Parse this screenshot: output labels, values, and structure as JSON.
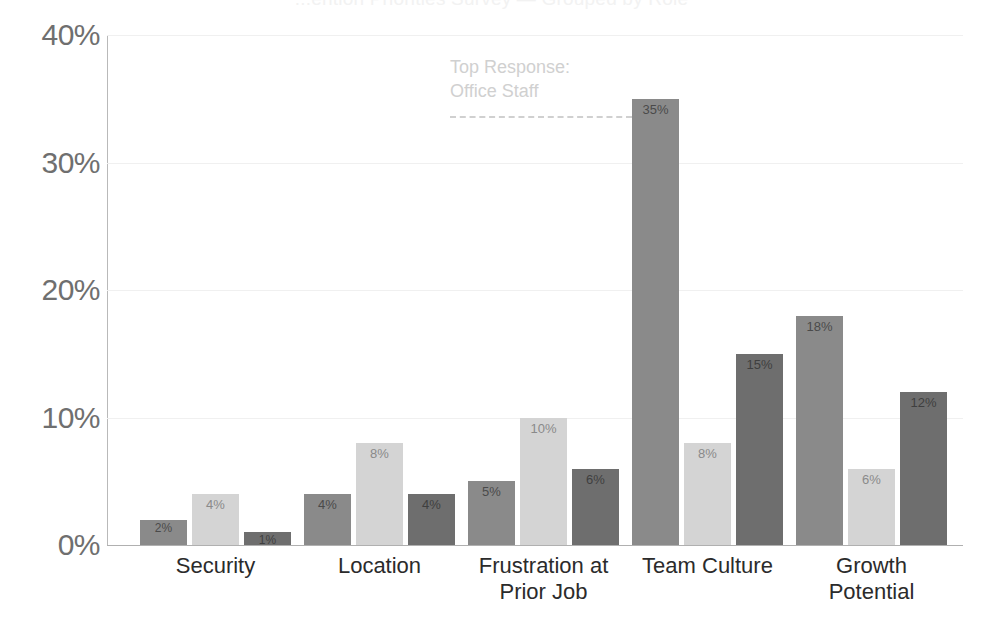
{
  "chart_data": {
    "type": "bar",
    "title": "...ention Priorities Survey — Grouped by Role",
    "xlabel": "",
    "ylabel": "",
    "ylim": [
      0,
      40
    ],
    "grid": true,
    "legend_position": "none",
    "y_ticks": [
      "0%",
      "10%",
      "20%",
      "30%",
      "40%"
    ],
    "y_tick_values": [
      0,
      10,
      20,
      30,
      40
    ],
    "categories": [
      "Security",
      "Location",
      "Frustration at\nPrior Job",
      "Team Culture",
      "Growth\nPotential"
    ],
    "series": [
      {
        "name": "Series 1",
        "color": "#8a8a8a",
        "values": [
          2,
          4,
          5,
          35,
          18
        ],
        "labels": [
          "2%",
          "4%",
          "5%",
          "35%",
          "18%"
        ]
      },
      {
        "name": "Series 2",
        "color": "#d4d4d4",
        "values": [
          4,
          8,
          10,
          8,
          6
        ],
        "labels": [
          "4%",
          "8%",
          "10%",
          "8%",
          "6%"
        ]
      },
      {
        "name": "Series 3",
        "color": "#6e6e6e",
        "values": [
          1,
          4,
          6,
          15,
          12
        ],
        "labels": [
          "1%",
          "4%",
          "6%",
          "15%",
          "12%"
        ]
      }
    ],
    "annotations": [
      {
        "text": "Top Response:\nOffice Staff",
        "target_value": 35,
        "target_series": "Series 1",
        "target_category": "Team Culture",
        "color": "#d0d0d0",
        "connector": "dashed-line"
      }
    ]
  },
  "colors": {
    "series_1": "#8a8a8a",
    "series_2": "#d4d4d4",
    "series_3": "#6e6e6e",
    "axis": "#b0b0b0",
    "grid": "#f0f0f0",
    "tick_text": "#6f6f6f",
    "category_text": "#2b2b2b",
    "annotation": "#d0d0d0",
    "background": "#ffffff"
  }
}
